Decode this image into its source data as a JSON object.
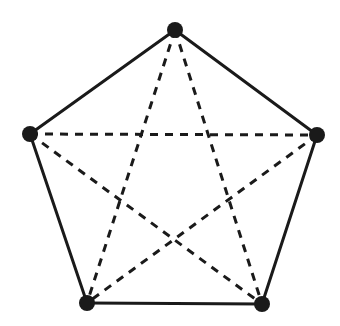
{
  "diagram": {
    "type": "complete-graph-K5",
    "colors": {
      "background": "#ffffff",
      "stroke": "#1a1a1a",
      "node": "#1a1a1a"
    },
    "nodes": [
      {
        "id": "top",
        "x": 175,
        "y": 30
      },
      {
        "id": "right",
        "x": 317,
        "y": 135
      },
      {
        "id": "bottom-right",
        "x": 262,
        "y": 304
      },
      {
        "id": "bottom-left",
        "x": 87,
        "y": 303
      },
      {
        "id": "left",
        "x": 30,
        "y": 134
      }
    ],
    "edges_solid": [
      [
        "top",
        "right"
      ],
      [
        "right",
        "bottom-right"
      ],
      [
        "bottom-right",
        "bottom-left"
      ],
      [
        "bottom-left",
        "left"
      ],
      [
        "left",
        "top"
      ]
    ],
    "edges_dashed": [
      [
        "top",
        "bottom-right"
      ],
      [
        "top",
        "bottom-left"
      ],
      [
        "left",
        "right"
      ],
      [
        "left",
        "bottom-right"
      ],
      [
        "right",
        "bottom-left"
      ]
    ],
    "node_radius": 8
  }
}
